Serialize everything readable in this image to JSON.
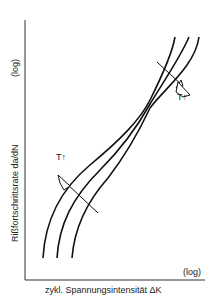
{
  "diagram": {
    "type": "line",
    "title": "",
    "ylabel": "Rißfortschrittsrate da/dN",
    "ylabel_scale": "(log)",
    "xlabel": "zykl. Spannungsintensität ΔK",
    "xlabel_scale": "(log)",
    "annotations": [
      {
        "text": "T↑",
        "position": "upper-right",
        "arrow": "down-right"
      },
      {
        "text": "T↑",
        "position": "lower-left",
        "arrow": "up-left"
      }
    ],
    "curves": 3
  }
}
